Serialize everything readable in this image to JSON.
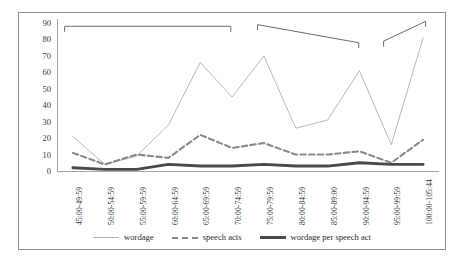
{
  "chart_data": {
    "type": "line",
    "title": "",
    "subtitle": "",
    "xlabel": "",
    "ylabel": "",
    "ylim": [
      0,
      90
    ],
    "ytick_step": 10,
    "yticks": [
      90,
      80,
      70,
      60,
      50,
      40,
      30,
      20,
      10,
      0
    ],
    "grid": false,
    "legend_position": "bottom",
    "categories": [
      "45:00-49:59",
      "50:00-54:59",
      "55:00-59:59",
      "60:00-64:59",
      "65:00-69:59",
      "70:00-74:59",
      "75:00-79:59",
      "80:00-84:59",
      "85:00-89:00",
      "90:00-94:59",
      "95:00-99:59",
      "100:00-105:44"
    ],
    "series": [
      {
        "name": "wordage",
        "style": "thin-solid",
        "color": "#b0b0b0",
        "values": [
          21,
          4,
          9,
          28,
          66,
          45,
          70,
          26,
          31,
          61,
          16,
          81
        ]
      },
      {
        "name": "speech acts",
        "style": "dashed",
        "color": "#8a8a8a",
        "values": [
          11,
          4,
          10,
          8,
          22,
          14,
          17,
          10,
          10,
          12,
          5,
          19
        ]
      },
      {
        "name": "wordage per speech act",
        "style": "thick-solid",
        "color": "#4a4a4a",
        "values": [
          2,
          1,
          1,
          4,
          3,
          3,
          4,
          3,
          3,
          5,
          4,
          4
        ]
      }
    ],
    "annotations": [
      {
        "name": "bracket-1",
        "type": "bracket",
        "spans_categories": [
          "45:00-49:59",
          "70:00-74:59"
        ],
        "label": "",
        "x1_frac": 0.02,
        "x2_frac": 0.455,
        "y1": 88,
        "y2": 88
      },
      {
        "name": "bracket-2",
        "type": "bracket",
        "spans_categories": [
          "75:00-79:59",
          "90:00-94:59"
        ],
        "label": "",
        "x1_frac": 0.525,
        "x2_frac": 0.79,
        "y1": 89,
        "y2": 78
      },
      {
        "name": "bracket-3",
        "type": "bracket",
        "spans_categories": [
          "95:00-99:59",
          "100:00-105:44"
        ],
        "label": "",
        "x1_frac": 0.855,
        "x2_frac": 0.965,
        "y1": 79,
        "y2": 91
      }
    ]
  },
  "legend": {
    "items": [
      {
        "label": "wordage",
        "icon": "thin-line-icon"
      },
      {
        "label": "speech acts",
        "icon": "dashed-line-icon"
      },
      {
        "label": "wordage per speech act",
        "icon": "thick-line-icon"
      }
    ]
  }
}
